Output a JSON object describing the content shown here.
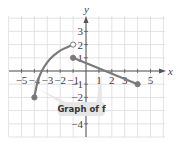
{
  "chart_data": {
    "type": "line",
    "title": "",
    "xlabel": "x",
    "ylabel": "y",
    "xlim": [
      -5.5,
      6
    ],
    "ylim": [
      -5,
      4.5
    ],
    "grid": true,
    "x_ticks": [
      -5,
      -4,
      -3,
      -2,
      -1,
      1,
      2,
      3,
      5
    ],
    "y_ticks": [
      3,
      2,
      1,
      -1,
      -2,
      -4
    ],
    "annotation": "Graph of f",
    "series": [
      {
        "name": "curve piece",
        "kind": "curve",
        "points": [
          [
            -4,
            -2
          ],
          [
            -3.8,
            -0.9
          ],
          [
            -3.5,
            -0.1
          ],
          [
            -3,
            0.7
          ],
          [
            -2.5,
            1.2
          ],
          [
            -2,
            1.55
          ],
          [
            -1.5,
            1.8
          ],
          [
            -1,
            2
          ]
        ],
        "start": {
          "x": -4,
          "y": -2,
          "closed": true
        },
        "end": {
          "x": -1,
          "y": 2,
          "closed": false
        }
      },
      {
        "name": "line piece",
        "kind": "segment",
        "points": [
          [
            -1,
            1
          ],
          [
            4,
            -1
          ]
        ],
        "start": {
          "x": -1,
          "y": 1,
          "closed": true
        },
        "end": {
          "x": 4,
          "y": -1,
          "closed": true
        }
      }
    ],
    "colors": {
      "curve": "#7a7a7a",
      "grid": "#dcdcdc",
      "axis": "#555555",
      "callout_fill": "#e6e6e6"
    }
  },
  "labels": {
    "x_axis": "x",
    "y_axis": "y",
    "callout": "Graph of f"
  }
}
